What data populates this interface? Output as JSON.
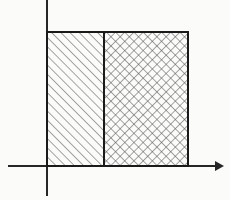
{
  "figure": {
    "background_color": "#fbfbfa",
    "ink_color": "#1a1a1a",
    "hatch_color": "#555555",
    "axis_color": "#262626"
  },
  "axes": {
    "origin": {
      "x": 47,
      "y": 166
    },
    "x_axis": {
      "name": "horizontal-axis",
      "start_x": 8,
      "end_x": 216,
      "y": 166,
      "stroke_width": 2,
      "arrow": {
        "present": true,
        "direction": "right",
        "tip_x": 224,
        "half_height": 5,
        "length": 9
      }
    },
    "y_axis": {
      "name": "vertical-axis",
      "x": 47,
      "start_y": 0,
      "end_y": 196,
      "stroke_width": 2,
      "arrow": {
        "present": false,
        "direction": "up"
      }
    }
  },
  "rectangle": {
    "name": "outer-rectangle",
    "left": 47,
    "right": 188,
    "top": 32,
    "bottom": 166,
    "width": 141,
    "height": 134,
    "stroke_width": 2,
    "stroke_color": "#1a1a1a",
    "fill": "none"
  },
  "divider": {
    "name": "vertical-divider-line",
    "x": 104,
    "top": 32,
    "bottom": 166,
    "stroke_width": 2,
    "stroke_color": "#1a1a1a"
  },
  "regions": [
    {
      "name": "left-region",
      "fill_pattern": "diagonal-hatch",
      "hatch_direction": "up-right-45",
      "hatch_spacing": 6.5,
      "hatch_stroke_width": 1.1,
      "hatch_color": "#5a5a5a",
      "left": 48,
      "right": 103,
      "top": 33,
      "bottom": 165
    },
    {
      "name": "right-region",
      "fill_pattern": "cross-hatch",
      "hatch_direction": "both-45",
      "hatch_spacing": 6.5,
      "hatch_stroke_width": 1.1,
      "hatch_color": "#5a5a5a",
      "left": 105,
      "right": 187,
      "top": 33,
      "bottom": 165
    }
  ],
  "labels": {
    "x_axis_label": "",
    "y_axis_label": "",
    "origin_label": "",
    "annotations": []
  }
}
